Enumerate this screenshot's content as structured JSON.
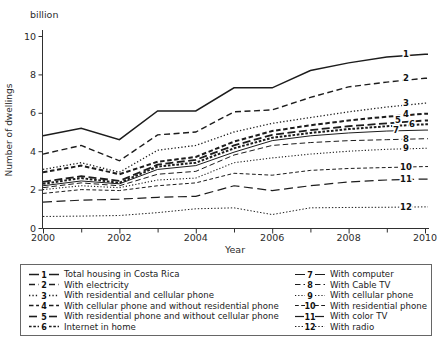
{
  "chart_data": {
    "type": "line",
    "unit_label": "billion",
    "ylabel": "Number of dwellings",
    "xlabel": "Year",
    "x": [
      2000,
      2001,
      2002,
      2003,
      2004,
      2005,
      2006,
      2007,
      2008,
      2009,
      2010
    ],
    "x_major_ticks": [
      2000,
      2002,
      2004,
      2006,
      2008,
      2010
    ],
    "x_minor_ticks": [
      2001,
      2003,
      2005,
      2007,
      2009
    ],
    "x_tick_labels": [
      "2000",
      "2002",
      "2004",
      "2006",
      "2008",
      "2010"
    ],
    "y_ticks": [
      0,
      2,
      4,
      6,
      8,
      10
    ],
    "xlim": [
      2000,
      2010
    ],
    "ylim": [
      0,
      10
    ],
    "line_color": "#1c1c1c",
    "grid": false,
    "legend_position": "bottom-box-two-columns",
    "series": [
      {
        "id": "1",
        "label": "Total housing in Costa Rica",
        "values": [
          4.8,
          5.2,
          4.6,
          6.1,
          6.1,
          7.3,
          7.3,
          8.2,
          8.6,
          8.9,
          9.05
        ],
        "dash": "",
        "width": 1.5,
        "label_dx": 0
      },
      {
        "id": "2",
        "label": "With electricity",
        "values": [
          3.85,
          4.3,
          3.5,
          4.85,
          5.0,
          6.05,
          6.15,
          6.8,
          7.35,
          7.6,
          7.8
        ],
        "dash": "6,3.5",
        "width": 1.4,
        "label_dx": 0
      },
      {
        "id": "3",
        "label": "With residential and cellular phone",
        "values": [
          3.05,
          3.4,
          2.9,
          4.05,
          4.3,
          5.0,
          5.45,
          5.75,
          6.05,
          6.3,
          6.5
        ],
        "dash": "1.3,2.1",
        "width": 1.3,
        "label_dx": 0
      },
      {
        "id": "4",
        "label": "With cellular phone and without residential phone",
        "values": [
          2.9,
          3.25,
          2.8,
          3.45,
          3.7,
          4.5,
          5.05,
          5.35,
          5.6,
          5.8,
          5.95
        ],
        "dash": "4.5,2.6",
        "width": 2.0,
        "label_dx": 0
      },
      {
        "id": "5",
        "label": "With residential phone and without cellular phone",
        "values": [
          2.4,
          2.7,
          2.45,
          3.3,
          3.55,
          4.3,
          4.85,
          5.1,
          5.3,
          5.45,
          5.6
        ],
        "dash": "8,3.5",
        "width": 1.8,
        "label_dx": -8
      },
      {
        "id": "6",
        "label": "Internet in home",
        "values": [
          2.3,
          2.6,
          2.35,
          3.2,
          3.4,
          4.15,
          4.7,
          4.95,
          5.15,
          5.3,
          5.4
        ],
        "dash": "2.6,1.7",
        "width": 2.0,
        "label_dx": 6
      },
      {
        "id": "7",
        "label": "With computer",
        "values": [
          2.2,
          2.45,
          2.3,
          3.05,
          3.25,
          3.95,
          4.55,
          4.8,
          4.95,
          5.05,
          5.1
        ],
        "dash": "",
        "width": 1.0,
        "label_dx": -10
      },
      {
        "id": "8",
        "label": "With Cable TV",
        "values": [
          2.1,
          2.35,
          2.2,
          2.8,
          2.95,
          3.8,
          4.3,
          4.45,
          4.55,
          4.6,
          4.65
        ],
        "dash": "5.5,3",
        "width": 1.0,
        "label_dx": 0
      },
      {
        "id": "9",
        "label": "With cellular phone",
        "values": [
          2.0,
          2.2,
          2.1,
          2.5,
          2.6,
          3.4,
          3.65,
          3.85,
          4.0,
          4.1,
          4.15
        ],
        "dash": "1.2,2",
        "width": 1.1,
        "label_dx": 0
      },
      {
        "id": "10",
        "label": "With residential phone",
        "values": [
          1.8,
          2.0,
          1.95,
          2.2,
          2.35,
          2.85,
          2.75,
          3.0,
          3.1,
          3.15,
          3.2
        ],
        "dash": "3.8,2.4",
        "width": 1.0,
        "label_dx": 0
      },
      {
        "id": "11",
        "label": "With color TV",
        "values": [
          1.35,
          1.45,
          1.5,
          1.6,
          1.65,
          2.2,
          1.95,
          2.2,
          2.4,
          2.5,
          2.55
        ],
        "dash": "9,4.5",
        "width": 1.2,
        "label_dx": 0
      },
      {
        "id": "12",
        "label": "With radio",
        "values": [
          0.6,
          0.62,
          0.65,
          0.8,
          1.0,
          1.05,
          0.7,
          1.05,
          1.07,
          1.08,
          1.1
        ],
        "dash": "1.4,1.9",
        "width": 1.0,
        "label_dx": 0
      }
    ]
  }
}
